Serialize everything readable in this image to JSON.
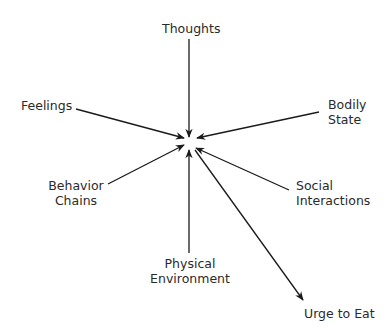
{
  "diagram": {
    "type": "radial-convergence",
    "center_node": "",
    "nodes": {
      "thoughts": {
        "line1": "Thoughts"
      },
      "feelings": {
        "line1": "Feelings"
      },
      "bodily_state": {
        "line1": "Bodily",
        "line2": "State"
      },
      "behavior_chains": {
        "line1": "Behavior",
        "line2": "Chains"
      },
      "social_interactions": {
        "line1": "Social",
        "line2": "Interactions"
      },
      "physical_environment": {
        "line1": "Physical",
        "line2": "Environment"
      },
      "urge_to_eat": {
        "line1": "Urge to Eat"
      }
    },
    "edges": [
      {
        "from": "Thoughts",
        "to": "center"
      },
      {
        "from": "Feelings",
        "to": "center"
      },
      {
        "from": "Bodily State",
        "to": "center"
      },
      {
        "from": "Behavior Chains",
        "to": "center"
      },
      {
        "from": "Social Interactions",
        "to": "center"
      },
      {
        "from": "Physical Environment",
        "to": "center"
      },
      {
        "from": "center",
        "to": "Urge to Eat"
      }
    ],
    "colors": {
      "line": "#1a1a1a",
      "text": "#2a2a2a",
      "background": "#ffffff"
    }
  }
}
